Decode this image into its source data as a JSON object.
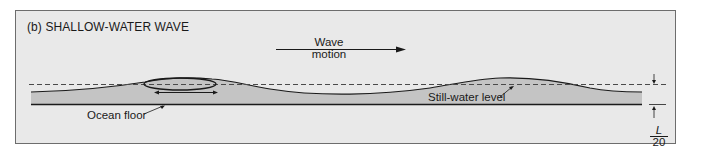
{
  "figure": {
    "panel_title": "(b) SHALLOW-WATER WAVE",
    "wave_motion_label_line1": "Wave",
    "wave_motion_label_line2": "motion",
    "ocean_floor_label": "Ocean floor",
    "still_water_label": "Still-water level",
    "depth_fraction_numerator": "L",
    "depth_fraction_denominator": "20"
  },
  "colors": {
    "panel_background": "#e9e9e9",
    "water_fill": "#c4c4c4",
    "line": "#1a1a1a",
    "frame_border": "#6d6d6d"
  }
}
